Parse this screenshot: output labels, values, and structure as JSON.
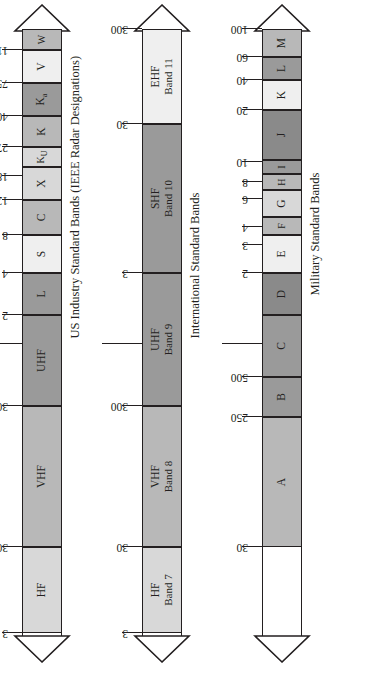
{
  "figure": {
    "axis_titles": {
      "mhz": "Frequency (MHz)",
      "ghz": "Frequency (GHz)"
    },
    "captions": {
      "us_industry": "US Industry Standard Bands (IEEE Radar Designations)",
      "international": "International Standard Bands",
      "military": "Military Standard Bands"
    },
    "colors": {
      "outline": "#231f20",
      "white": "#ffffff",
      "very_light": "#efefef",
      "light": "#d8d8d8",
      "medium": "#b8b8b8",
      "medium_dark": "#9a9a9a",
      "dark": "#8a8a8a"
    }
  },
  "chart_data": [
    {
      "type": "bar",
      "name": "us_industry_standard_bands",
      "title": "US Industry Standard Bands (IEEE Radar Designations)",
      "xlabel": "Frequency",
      "axis_scale": "log",
      "xlim": [
        3,
        300000
      ],
      "axis_titles": [
        "Frequency (MHz)",
        "Frequency (GHz)"
      ],
      "tick_labels": [
        "3",
        "30",
        "300",
        "2",
        "4",
        "8",
        "12",
        "18",
        "27",
        "40",
        "75",
        "110"
      ],
      "tick_values_mhz": [
        3,
        30,
        300,
        2000,
        4000,
        8000,
        12000,
        18000,
        27000,
        40000,
        75000,
        110000
      ],
      "unlabeled_boundary_tick_mhz": 1000,
      "segments": [
        {
          "label": "HF",
          "label2": "",
          "from_mhz": 3,
          "to_mhz": 30,
          "fill": "light"
        },
        {
          "label": "VHF",
          "label2": "",
          "from_mhz": 30,
          "to_mhz": 300,
          "fill": "medium"
        },
        {
          "label": "UHF",
          "label2": "",
          "from_mhz": 300,
          "to_mhz": 2000,
          "fill": "medium_dark"
        },
        {
          "label": "L",
          "label2": "",
          "from_mhz": 2000,
          "to_mhz": 4000,
          "fill": "medium_dark"
        },
        {
          "label": "S",
          "label2": "",
          "from_mhz": 4000,
          "to_mhz": 8000,
          "fill": "very_light"
        },
        {
          "label": "C",
          "label2": "",
          "from_mhz": 8000,
          "to_mhz": 12000,
          "fill": "medium"
        },
        {
          "label": "X",
          "label2": "",
          "from_mhz": 12000,
          "to_mhz": 18000,
          "fill": "light"
        },
        {
          "label": "Ku",
          "label2": "",
          "from_mhz": 18000,
          "to_mhz": 27000,
          "fill": "light"
        },
        {
          "label": "K",
          "label2": "",
          "from_mhz": 27000,
          "to_mhz": 40000,
          "fill": "medium"
        },
        {
          "label": "Ka",
          "label2": "",
          "from_mhz": 40000,
          "to_mhz": 75000,
          "fill": "medium_dark"
        },
        {
          "label": "V",
          "label2": "",
          "from_mhz": 75000,
          "to_mhz": 110000,
          "fill": "very_light"
        },
        {
          "label": "W",
          "label2": "",
          "from_mhz": 110000,
          "to_mhz": 300000,
          "fill": "medium"
        }
      ]
    },
    {
      "type": "bar",
      "name": "international_standard_bands",
      "title": "International Standard Bands",
      "axis_scale": "log",
      "tick_labels": [
        "3",
        "30",
        "300",
        "3",
        "30",
        "300"
      ],
      "segments": [
        {
          "label": "HF",
          "label2": "Band 7",
          "fill": "light"
        },
        {
          "label": "VHF",
          "label2": "Band 8",
          "fill": "medium"
        },
        {
          "label": "UHF",
          "label2": "Band 9",
          "fill": "medium_dark"
        },
        {
          "label": "SHF",
          "label2": "Band 10",
          "fill": "medium_dark"
        },
        {
          "label": "EHF",
          "label2": "Band 11",
          "fill": "very_light"
        }
      ]
    },
    {
      "type": "bar",
      "name": "military_standard_bands",
      "title": "Military Standard Bands",
      "axis_scale": "log",
      "tick_labels": [
        "30",
        "250",
        "500",
        "2",
        "3",
        "4",
        "6",
        "8",
        "10",
        "20",
        "40",
        "60",
        "100"
      ],
      "segments": [
        {
          "label": "A",
          "fill": "medium"
        },
        {
          "label": "B",
          "fill": "medium_dark"
        },
        {
          "label": "C",
          "fill": "medium_dark"
        },
        {
          "label": "D",
          "fill": "dark"
        },
        {
          "label": "E",
          "fill": "very_light"
        },
        {
          "label": "F",
          "fill": "medium"
        },
        {
          "label": "G",
          "fill": "light"
        },
        {
          "label": "H",
          "fill": "medium"
        },
        {
          "label": "I",
          "fill": "medium_dark"
        },
        {
          "label": "J",
          "fill": "dark"
        },
        {
          "label": "K",
          "fill": "very_light"
        },
        {
          "label": "L",
          "fill": "medium_dark"
        },
        {
          "label": "M",
          "fill": "medium"
        }
      ]
    }
  ],
  "bars": [
    {
      "id": "us-industry",
      "y": 22,
      "caption": "US Industry Standard Bands (IEEE Radar Designations)",
      "axis_label_mhz": "Frequency (MHz)",
      "axis_label_ghz": "Frequency (GHz)",
      "segments": [
        {
          "name": "hf",
          "label": "HF",
          "start": 54,
          "end": 140,
          "fill": "#d8d8d8"
        },
        {
          "name": "vhf",
          "label": "VHF",
          "start": 140,
          "end": 281,
          "fill": "#b8b8b8"
        },
        {
          "name": "uhf",
          "label": "UHF",
          "start": 281,
          "end": 372,
          "fill": "#9a9a9a"
        },
        {
          "name": "l",
          "label": "L",
          "start": 372,
          "end": 414,
          "fill": "#9a9a9a"
        },
        {
          "name": "s",
          "label": "S",
          "start": 414,
          "end": 452,
          "fill": "#efefef"
        },
        {
          "name": "c",
          "label": "C",
          "start": 452,
          "end": 487,
          "fill": "#b8b8b8"
        },
        {
          "name": "x",
          "label": "X",
          "start": 487,
          "end": 520,
          "fill": "#d8d8d8"
        },
        {
          "name": "ku",
          "label": "Ku",
          "start": 520,
          "end": 540,
          "fill": "#d8d8d8"
        },
        {
          "name": "k",
          "label": "K",
          "start": 540,
          "end": 571,
          "fill": "#b8b8b8"
        },
        {
          "name": "ka",
          "label": "Ka",
          "start": 571,
          "end": 604,
          "fill": "#9a9a9a"
        },
        {
          "name": "v",
          "label": "V",
          "start": 604,
          "end": 637,
          "fill": "#efefef"
        },
        {
          "name": "w",
          "label": "W",
          "start": 637,
          "end": 658,
          "fill": "#b8b8b8"
        }
      ],
      "ticks": [
        {
          "label": "3",
          "pos": 54
        },
        {
          "label": "30",
          "pos": 140
        },
        {
          "label": "300",
          "pos": 281
        },
        {
          "label": "",
          "pos": 343,
          "long": true
        },
        {
          "label": "2",
          "pos": 372
        },
        {
          "label": "4",
          "pos": 414
        },
        {
          "label": "8",
          "pos": 452
        },
        {
          "label": "12",
          "pos": 487
        },
        {
          "label": "18",
          "pos": 511
        },
        {
          "label": "27",
          "pos": 540
        },
        {
          "label": "40",
          "pos": 571
        },
        {
          "label": "75",
          "pos": 604
        },
        {
          "label": "110",
          "pos": 637
        }
      ]
    },
    {
      "id": "international",
      "y": 142,
      "caption": "International Standard Bands",
      "segments": [
        {
          "name": "hf-band7",
          "label": "HF",
          "label2": "Band 7",
          "start": 54,
          "end": 140,
          "fill": "#d8d8d8"
        },
        {
          "name": "vhf-band8",
          "label": "VHF",
          "label2": "Band 8",
          "start": 140,
          "end": 281,
          "fill": "#b8b8b8"
        },
        {
          "name": "uhf-band9",
          "label": "UHF",
          "label2": "Band 9",
          "start": 281,
          "end": 414,
          "fill": "#9a9a9a"
        },
        {
          "name": "shf-band10",
          "label": "SHF",
          "label2": "Band 10",
          "start": 414,
          "end": 563,
          "fill": "#9a9a9a"
        },
        {
          "name": "ehf-band11",
          "label": "EHF",
          "label2": "Band 11",
          "start": 563,
          "end": 658,
          "fill": "#efefef"
        }
      ],
      "ticks": [
        {
          "label": "3",
          "pos": 54
        },
        {
          "label": "30",
          "pos": 140
        },
        {
          "label": "300",
          "pos": 281
        },
        {
          "label": "",
          "pos": 343,
          "long": true
        },
        {
          "label": "3",
          "pos": 414
        },
        {
          "label": "30",
          "pos": 563
        },
        {
          "label": "300",
          "pos": 658
        }
      ]
    },
    {
      "id": "military",
      "y": 262,
      "caption": "Military Standard Bands",
      "segments": [
        {
          "name": "band-a",
          "label": "A",
          "start": 140,
          "end": 270,
          "fill": "#b8b8b8"
        },
        {
          "name": "band-b",
          "label": "B",
          "start": 270,
          "end": 310,
          "fill": "#9a9a9a"
        },
        {
          "name": "band-c",
          "label": "C",
          "start": 310,
          "end": 372,
          "fill": "#9a9a9a"
        },
        {
          "name": "band-d",
          "label": "D",
          "start": 372,
          "end": 414,
          "fill": "#8a8a8a"
        },
        {
          "name": "band-e",
          "label": "E",
          "start": 414,
          "end": 452,
          "fill": "#efefef"
        },
        {
          "name": "band-f",
          "label": "F",
          "start": 452,
          "end": 470,
          "fill": "#b8b8b8"
        },
        {
          "name": "band-g",
          "label": "G",
          "start": 470,
          "end": 497,
          "fill": "#d8d8d8"
        },
        {
          "name": "band-h",
          "label": "H",
          "start": 497,
          "end": 513,
          "fill": "#b8b8b8"
        },
        {
          "name": "band-i",
          "label": "I",
          "start": 513,
          "end": 527,
          "fill": "#9a9a9a"
        },
        {
          "name": "band-j",
          "label": "J",
          "start": 527,
          "end": 577,
          "fill": "#8a8a8a"
        },
        {
          "name": "band-k",
          "label": "K",
          "start": 577,
          "end": 607,
          "fill": "#efefef"
        },
        {
          "name": "band-l",
          "label": "L",
          "start": 607,
          "end": 630,
          "fill": "#9a9a9a"
        },
        {
          "name": "band-m",
          "label": "M",
          "start": 630,
          "end": 658,
          "fill": "#b8b8b8"
        }
      ],
      "ticks": [
        {
          "label": "30",
          "pos": 140
        },
        {
          "label": "250",
          "pos": 270
        },
        {
          "label": "500",
          "pos": 310
        },
        {
          "label": "",
          "pos": 343,
          "long": true
        },
        {
          "label": "2",
          "pos": 414
        },
        {
          "label": "3",
          "pos": 442
        },
        {
          "label": "4",
          "pos": 460
        },
        {
          "label": "6",
          "pos": 488
        },
        {
          "label": "8",
          "pos": 505
        },
        {
          "label": "10",
          "pos": 525
        },
        {
          "label": "20",
          "pos": 577
        },
        {
          "label": "40",
          "pos": 607
        },
        {
          "label": "60",
          "pos": 630
        },
        {
          "label": "100",
          "pos": 658
        }
      ]
    }
  ]
}
